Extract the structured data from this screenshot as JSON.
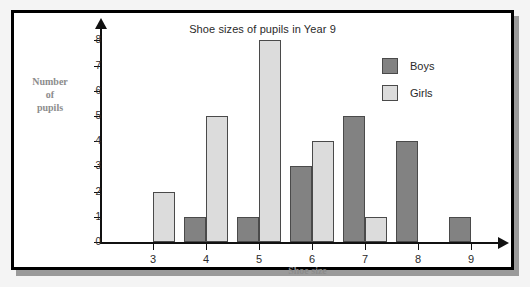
{
  "chart_data": {
    "type": "bar",
    "title": "Shoe sizes of pupils in Year 9",
    "xlabel": "Shoe size",
    "ylabel": "Number of pupils",
    "ylabel_lines": [
      "Number",
      "of",
      "pupils"
    ],
    "categories": [
      "3",
      "4",
      "5",
      "6",
      "7",
      "8",
      "9"
    ],
    "series": [
      {
        "name": "Boys",
        "color": "#828282",
        "values": [
          0,
          1,
          1,
          3,
          5,
          4,
          1
        ]
      },
      {
        "name": "Girls",
        "color": "#dcdcdc",
        "values": [
          2,
          5,
          8,
          4,
          1,
          0,
          0
        ]
      }
    ],
    "ylim": [
      0,
      8
    ],
    "ytick_labels": [
      "0",
      "1",
      "2",
      "3",
      "4",
      "5",
      "6",
      "7",
      "8"
    ],
    "xtick_labels": [
      "3",
      "4",
      "5",
      "6",
      "7",
      "8",
      "9"
    ],
    "grid": false,
    "legend_position": "top-right",
    "legend": [
      {
        "label": "Boys",
        "swatch": "dark-gray-swatch"
      },
      {
        "label": "Girls",
        "swatch": "light-gray-swatch"
      }
    ],
    "axis_style": "arrow-tipped"
  }
}
